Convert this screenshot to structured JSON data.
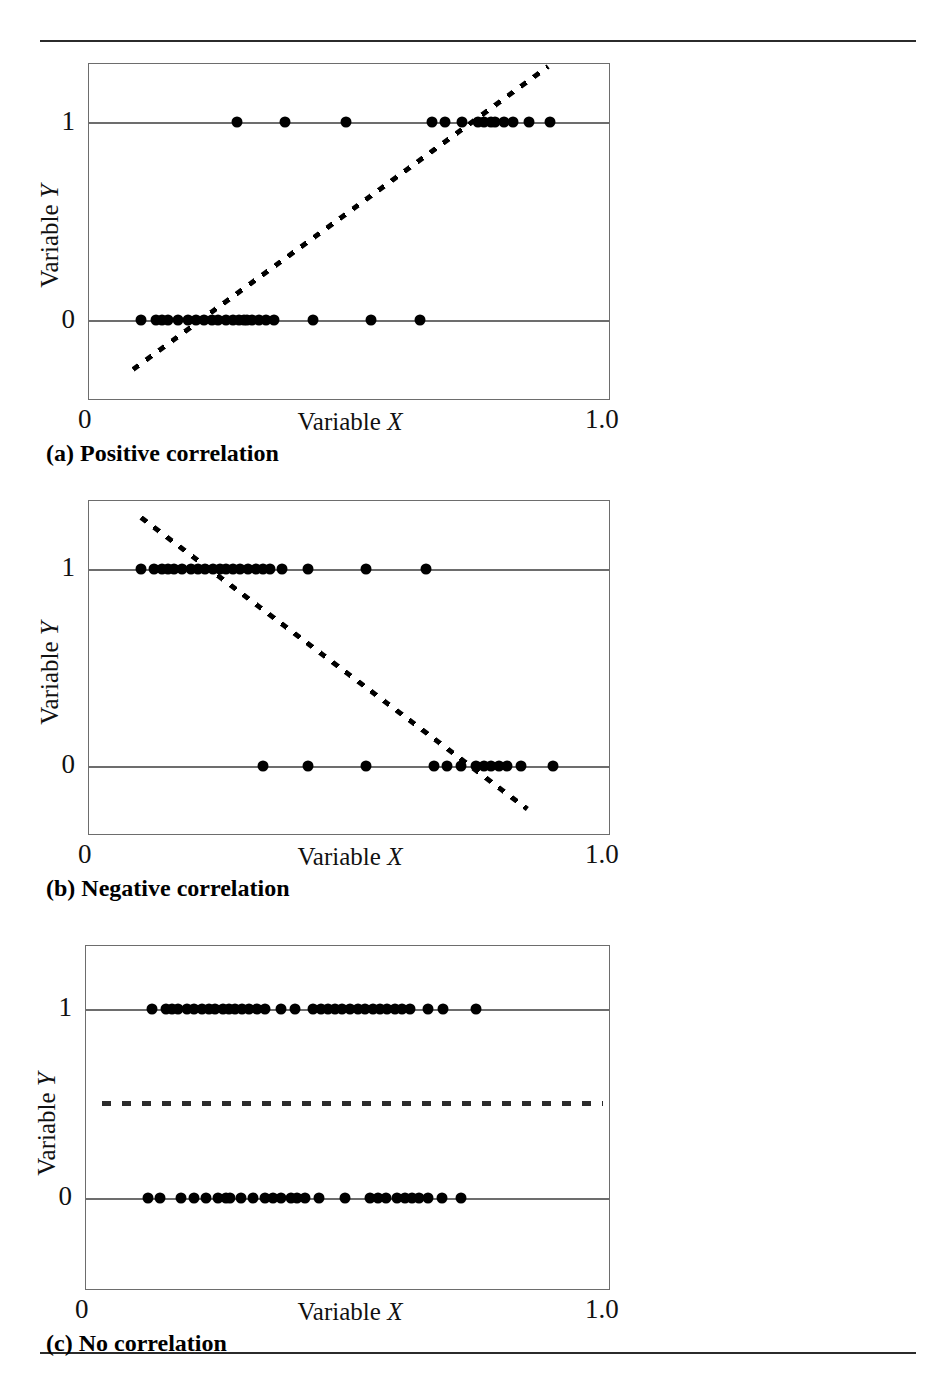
{
  "figure": {
    "rules": {
      "top": true,
      "bottom": true
    },
    "axis": {
      "x_min_label": "0",
      "x_max_label": "1.0",
      "y_labels": [
        "1",
        "0"
      ],
      "x_title_prefix": "Variable ",
      "x_title_var": "X",
      "y_title_prefix": "Variable ",
      "y_title_var": "Y"
    },
    "panels": [
      {
        "key": "a",
        "tag": "(a)",
        "caption": "Positive correlation"
      },
      {
        "key": "b",
        "tag": "(b)",
        "caption": "Negative correlation"
      },
      {
        "key": "c",
        "tag": "(c)",
        "caption": "No correlation"
      }
    ]
  },
  "chart_data": [
    {
      "id": "panel-a",
      "type": "scatter",
      "title": "(a) Positive correlation",
      "xlabel": "Variable X",
      "ylabel": "Variable Y",
      "xlim": [
        0,
        1.0
      ],
      "ylim": [
        -0.45,
        1.3
      ],
      "yticks": [
        0,
        1
      ],
      "xticks": [
        0,
        1.0
      ],
      "grid": "horizontal-at-y0-and-y1",
      "points_y1_x": [
        0.283,
        0.375,
        0.493,
        0.657,
        0.682,
        0.715,
        0.745,
        0.757,
        0.77,
        0.778,
        0.795,
        0.812,
        0.843,
        0.883
      ],
      "points_y0_x": [
        0.1,
        0.128,
        0.14,
        0.152,
        0.17,
        0.19,
        0.205,
        0.22,
        0.235,
        0.248,
        0.262,
        0.275,
        0.288,
        0.296,
        0.303,
        0.312,
        0.325,
        0.34,
        0.355,
        0.43,
        0.54,
        0.635
      ],
      "fit_line": {
        "style": "dashed",
        "x_start": 0.085,
        "y_start": -0.25,
        "x_end": 0.88,
        "y_end": 1.28
      },
      "n_points": 36
    },
    {
      "id": "panel-b",
      "type": "scatter",
      "title": "(b) Negative correlation",
      "xlabel": "Variable X",
      "ylabel": "Variable Y",
      "xlim": [
        0,
        1.0
      ],
      "ylim": [
        -0.45,
        1.3
      ],
      "yticks": [
        0,
        1
      ],
      "xticks": [
        0,
        1.0
      ],
      "grid": "horizontal-at-y0-and-y1",
      "points_y1_x": [
        0.1,
        0.125,
        0.14,
        0.152,
        0.163,
        0.178,
        0.196,
        0.208,
        0.222,
        0.238,
        0.25,
        0.263,
        0.275,
        0.29,
        0.305,
        0.32,
        0.333,
        0.347,
        0.37,
        0.42,
        0.53,
        0.645
      ],
      "points_y0_x": [
        0.333,
        0.42,
        0.53,
        0.66,
        0.685,
        0.712,
        0.742,
        0.757,
        0.77,
        0.785,
        0.8,
        0.828,
        0.888
      ],
      "fit_line": {
        "style": "dashed",
        "x_start": 0.1,
        "y_start": 1.26,
        "x_end": 0.84,
        "y_end": -0.22
      },
      "n_points": 35
    },
    {
      "id": "panel-c",
      "type": "scatter",
      "title": "(c) No correlation",
      "xlabel": "Variable X",
      "ylabel": "Variable Y",
      "xlim": [
        0,
        1.0
      ],
      "ylim": [
        -0.45,
        1.3
      ],
      "yticks": [
        0,
        1
      ],
      "xticks": [
        0,
        1.0
      ],
      "grid": "horizontal-at-y0-and-y1",
      "points_y1_x": [
        0.126,
        0.152,
        0.163,
        0.176,
        0.192,
        0.205,
        0.22,
        0.234,
        0.246,
        0.26,
        0.272,
        0.283,
        0.297,
        0.31,
        0.325,
        0.34,
        0.372,
        0.398,
        0.432,
        0.447,
        0.46,
        0.474,
        0.487,
        0.503,
        0.518,
        0.532,
        0.546,
        0.56,
        0.573,
        0.588,
        0.602,
        0.617,
        0.652,
        0.68,
        0.742
      ],
      "points_y0_x": [
        0.118,
        0.14,
        0.18,
        0.205,
        0.228,
        0.252,
        0.267,
        0.275,
        0.296,
        0.318,
        0.34,
        0.356,
        0.372,
        0.39,
        0.402,
        0.418,
        0.444,
        0.493,
        0.54,
        0.556,
        0.572,
        0.593,
        0.608,
        0.62,
        0.635,
        0.652,
        0.678,
        0.715
      ],
      "fit_line": {
        "style": "dotted",
        "x_start": 0.03,
        "y_start": 0.5,
        "x_end": 0.985,
        "y_end": 0.5
      },
      "n_points": 63
    }
  ]
}
